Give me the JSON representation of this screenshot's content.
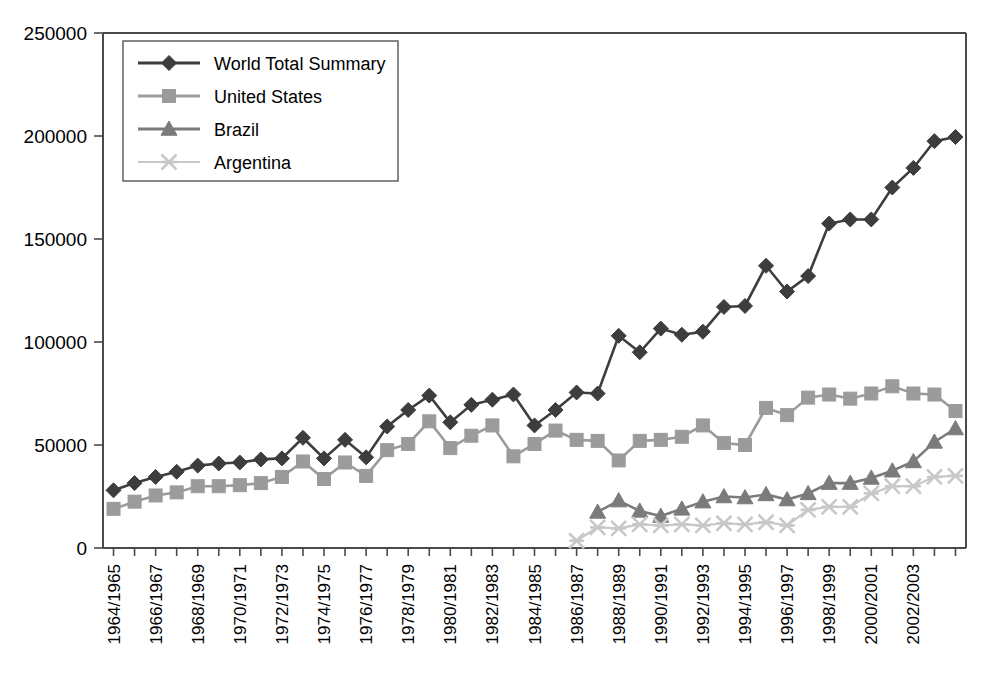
{
  "chart_data": {
    "type": "line",
    "title": "",
    "xlabel": "",
    "ylabel": "",
    "ylim": [
      0,
      250000
    ],
    "ytick_values": [
      0,
      50000,
      100000,
      150000,
      200000,
      250000
    ],
    "ytick_labels": [
      "0",
      "50000",
      "100000",
      "150000",
      "200000",
      "250000"
    ],
    "grid": false,
    "legend_position": "top-left",
    "x": [
      "1964/1965",
      "1965/1966",
      "1966/1967",
      "1967/1968",
      "1968/1969",
      "1969/1970",
      "1970/1971",
      "1971/1972",
      "1972/1973",
      "1973/1974",
      "1974/1975",
      "1975/1976",
      "1976/1977",
      "1977/1978",
      "1978/1979",
      "1979/1980",
      "1980/1981",
      "1981/1982",
      "1982/1983",
      "1983/1984",
      "1984/1985",
      "1985/1986",
      "1986/1987",
      "1987/1988",
      "1988/1989",
      "1989/1990",
      "1990/1991",
      "1991/1992",
      "1992/1993",
      "1993/1994",
      "1994/1995",
      "1995/1996",
      "1996/1997",
      "1997/1998",
      "1998/1999",
      "1999/2000",
      "2000/2001",
      "2001/2002",
      "2002/2003",
      "2003/2004",
      "2004/2005"
    ],
    "xtick_labels_shown": [
      "1964/1965",
      "1966/1967",
      "1968/1969",
      "1970/1971",
      "1972/1973",
      "1974/1975",
      "1976/1977",
      "1978/1979",
      "1980/1981",
      "1982/1983",
      "1984/1985",
      "1986/1987",
      "1988/1989",
      "1990/1991",
      "1992/1993",
      "1994/1995",
      "1996/1997",
      "1998/1999",
      "2000/2001",
      "2002/2003"
    ],
    "series": [
      {
        "name": "World Total Summary",
        "color": "#3d3d3d",
        "marker": "diamond",
        "values": [
          28000,
          31500,
          34500,
          37000,
          40000,
          41000,
          41500,
          43000,
          43500,
          53500,
          43500,
          52500,
          44000,
          59000,
          67000,
          74000,
          61000,
          69500,
          72000,
          74500,
          59500,
          67000,
          75500,
          75000,
          103000,
          95000,
          106500,
          103500,
          105000,
          117000,
          117500,
          137000,
          124500,
          132000,
          157500,
          159500,
          159500,
          175000,
          184500,
          197500,
          199500
        ]
      },
      {
        "name": "United States",
        "color": "#9b9b9b",
        "marker": "square",
        "values": [
          19000,
          22500,
          25500,
          27000,
          30000,
          30000,
          30500,
          31500,
          34500,
          42000,
          33500,
          41500,
          35000,
          47500,
          50500,
          61500,
          48500,
          54500,
          59500,
          44500,
          50500,
          57000,
          52500,
          52000,
          42500,
          52000,
          52500,
          54000,
          59500,
          51000,
          50000,
          68000,
          64500,
          73000,
          74500,
          72500,
          75000,
          78500,
          75000,
          74500,
          66500
        ]
      },
      {
        "name": "Brazil",
        "color": "#7b7b7b",
        "marker": "triangle",
        "values": [
          null,
          null,
          null,
          null,
          null,
          null,
          null,
          null,
          null,
          null,
          null,
          null,
          null,
          null,
          null,
          null,
          null,
          null,
          null,
          null,
          null,
          null,
          null,
          17500,
          23000,
          18000,
          15500,
          19000,
          22500,
          25000,
          24500,
          26000,
          23500,
          26500,
          31500,
          31500,
          34000,
          37500,
          42000,
          51500,
          58000
        ]
      },
      {
        "name": "Argentina",
        "color": "#c8c8c8",
        "marker": "cross",
        "values": [
          null,
          null,
          null,
          null,
          null,
          null,
          null,
          null,
          null,
          null,
          null,
          null,
          null,
          null,
          null,
          null,
          null,
          null,
          null,
          null,
          null,
          null,
          3500,
          10000,
          9500,
          11500,
          11000,
          11500,
          11000,
          12000,
          11500,
          12500,
          11000,
          18500,
          20000,
          20000,
          26500,
          30000,
          30000,
          34500,
          35000
        ]
      }
    ]
  },
  "legend": {
    "entries": [
      {
        "label": "World Total Summary"
      },
      {
        "label": "United States"
      },
      {
        "label": "Brazil"
      },
      {
        "label": "Argentina"
      }
    ]
  }
}
